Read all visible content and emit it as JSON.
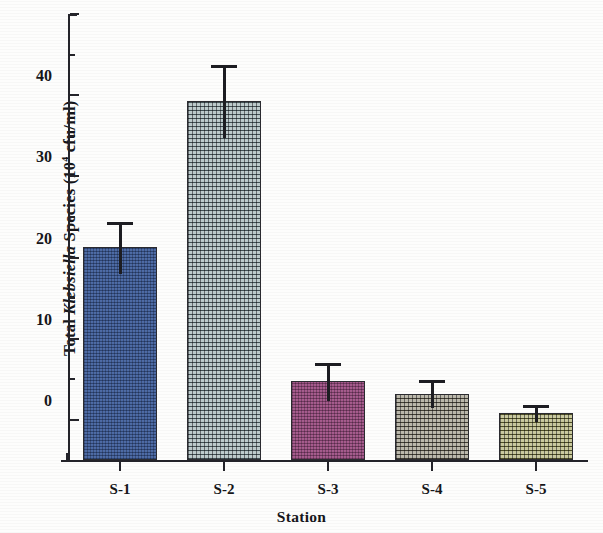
{
  "chart_data": {
    "type": "bar",
    "title": "",
    "xlabel": "Station",
    "ylabel_parts": {
      "prefix": "Total ",
      "italic": "Klebsiella",
      "suffix": " Species (10",
      "superscript": "4",
      "tail": " cfu/ml)"
    },
    "ylabel": "Total Klebsiella Species (10^4 cfu/ml)",
    "categories": [
      "S-1",
      "S-2",
      "S-3",
      "S-4",
      "S-5"
    ],
    "values": [
      21,
      39,
      4.5,
      3.0,
      0.6
    ],
    "errors": [
      3.0,
      4.3,
      2.2,
      1.5,
      0.9
    ],
    "ylim": [
      0,
      50
    ],
    "ytick_labels": [
      "0",
      "10",
      "20",
      "30",
      "40",
      "50"
    ],
    "ytick_values": [
      0,
      10,
      20,
      30,
      40,
      50
    ],
    "yminor_values": [
      5,
      15,
      25,
      35,
      45
    ],
    "grid": false,
    "legend": "none",
    "bar_colors": [
      "#3a5c9e",
      "#6d8c8e",
      "#9e4a82",
      "#6b6548",
      "#8a8a2a"
    ],
    "bar_patterns": [
      "fine-grid",
      "coarse-grid",
      "fine-grid",
      "coarse-grid",
      "coarse-grid"
    ],
    "error_bar_style": "upper-only-with-cap",
    "axis_color": "#24242a"
  },
  "axis": {
    "x_title": "Station"
  }
}
